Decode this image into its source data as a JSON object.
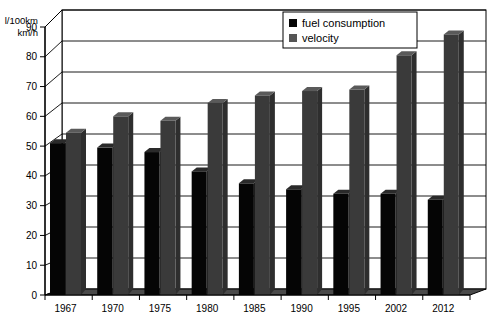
{
  "chart_data": {
    "type": "bar",
    "title": "",
    "subtitle": "",
    "xlabel": "",
    "ylabel": "l/100km\nkm/h",
    "ylabel_lines": [
      "l/100km",
      "km/h"
    ],
    "ylim": [
      0,
      90
    ],
    "ytick_step": 10,
    "yticks": [
      0,
      10,
      20,
      30,
      40,
      50,
      60,
      70,
      80,
      90
    ],
    "ytick_labels": [
      "0",
      "10",
      "20",
      "30",
      "40",
      "50",
      "60",
      "70",
      "80",
      "90"
    ],
    "grid": true,
    "grid_axis": "y",
    "legend_position": "top-right",
    "style": "3d-grouped-bar",
    "categories": [
      "1967",
      "1970",
      "1975",
      "1980",
      "1985",
      "1990",
      "1995",
      "2002",
      "2012"
    ],
    "series": [
      {
        "name": "fuel consumption",
        "color": "#050505",
        "unit": "l/100km",
        "values": [
          51,
          49.5,
          48,
          41.5,
          37.5,
          35.5,
          34,
          34,
          32
        ]
      },
      {
        "name": "velocity",
        "color": "#3a3a3a",
        "unit": "km/h",
        "values": [
          54.5,
          60,
          58.5,
          64.5,
          67,
          68.5,
          69,
          80.5,
          87.5
        ]
      }
    ]
  },
  "legend": {
    "items": [
      {
        "label": "fuel consumption",
        "swatch": "#050505"
      },
      {
        "label": "velocity",
        "swatch": "#555555"
      }
    ]
  },
  "colors": {
    "bar_fuel": "#050505",
    "bar_fuel_top": "#2a2a2a",
    "bar_fuel_side": "#1a1a1a",
    "bar_velocity": "#3a3a3a",
    "bar_velocity_top": "#5a5a5a",
    "bar_velocity_side": "#2e2e2e",
    "floor": "#4a4a4a",
    "wall": "#ffffff",
    "gridline": "#000000",
    "frame": "#000000",
    "background": "#ffffff"
  }
}
